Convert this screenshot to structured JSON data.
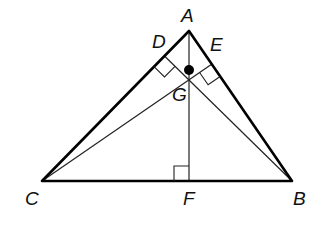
{
  "diagram": {
    "type": "geometry",
    "colors": {
      "stroke": "#000000",
      "background": "#ffffff"
    },
    "points": {
      "A": {
        "label": "A",
        "x": 189,
        "y": 31
      },
      "B": {
        "label": "B",
        "x": 292,
        "y": 181
      },
      "C": {
        "label": "C",
        "x": 42,
        "y": 181
      },
      "D": {
        "label": "D",
        "x": 164.5,
        "y": 56
      },
      "E": {
        "label": "E",
        "x": 212,
        "y": 64
      },
      "F": {
        "label": "F",
        "x": 189,
        "y": 181
      },
      "G": {
        "label": "G",
        "x": 189,
        "y": 70
      }
    },
    "sides": [
      "AB",
      "BC",
      "CA"
    ],
    "altitudes": [
      "AF",
      "BD",
      "CE"
    ],
    "right_angles": [
      "AFC",
      "ADB",
      "AEC"
    ],
    "highlighted_point": "G"
  }
}
